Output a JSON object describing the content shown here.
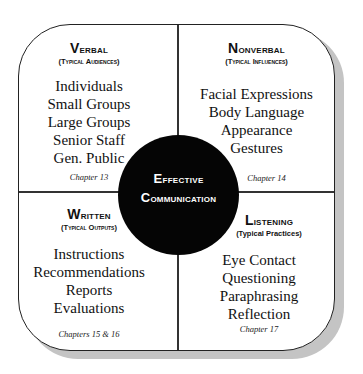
{
  "diagram": {
    "center": {
      "line1_cap": "E",
      "line1_rest": "ffective",
      "line2_cap": "C",
      "line2_rest": "ommunication"
    },
    "quadrants": [
      {
        "position": "top-left",
        "title_cap": "V",
        "title_rest": "erbal",
        "subtitle": "(Typical Audiences)",
        "items": [
          "Individuals",
          "Small Groups",
          "Large Groups",
          "Senior Staff",
          "Gen. Public"
        ],
        "chapter": "Chapter 13"
      },
      {
        "position": "top-right",
        "title_cap": "N",
        "title_rest": "onverbal",
        "subtitle": "(Typical Influences)",
        "items": [
          "Facial Expressions",
          "Body Language",
          "Appearance",
          "Gestures"
        ],
        "chapter": "Chapter 14"
      },
      {
        "position": "bottom-left",
        "title_cap": "W",
        "title_rest": "ritten",
        "subtitle": "(Typical Outputs)",
        "items": [
          "Instructions",
          "Recommendations",
          "Reports",
          "Evaluations"
        ],
        "chapter": "Chapters 15 & 16"
      },
      {
        "position": "bottom-right",
        "title_cap": "L",
        "title_rest": "istening",
        "subtitle": "(Typical Practices)",
        "items": [
          "Eye Contact",
          "Questioning",
          "Paraphrasing",
          "Reflection"
        ],
        "chapter": "Chapter 17"
      }
    ],
    "colors": {
      "hub_fill": "#050505",
      "hub_text": "#ffffff",
      "border": "#222222",
      "shadow": "#c4c4c4",
      "background": "#ffffff"
    }
  }
}
